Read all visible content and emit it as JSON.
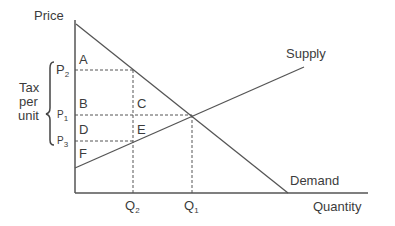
{
  "axes": {
    "y_label": "Price",
    "x_label": "Quantity"
  },
  "curves": {
    "supply_label": "Supply",
    "demand_label": "Demand"
  },
  "price_levels": {
    "p2": {
      "main": "P",
      "sub": "2"
    },
    "p1": {
      "main": "P",
      "sub": "1"
    },
    "p3": {
      "main": "P",
      "sub": "3"
    }
  },
  "quantity_levels": {
    "q2": {
      "main": "Q",
      "sub": "2"
    },
    "q1": {
      "main": "Q",
      "sub": "1"
    }
  },
  "areas": {
    "a": "A",
    "b": "B",
    "c": "C",
    "d": "D",
    "e": "E",
    "f": "F"
  },
  "bracket": {
    "line1": "Tax",
    "line2": "per",
    "line3": "unit"
  },
  "colors": {
    "line": "#555555",
    "text": "#3c3c3c"
  }
}
